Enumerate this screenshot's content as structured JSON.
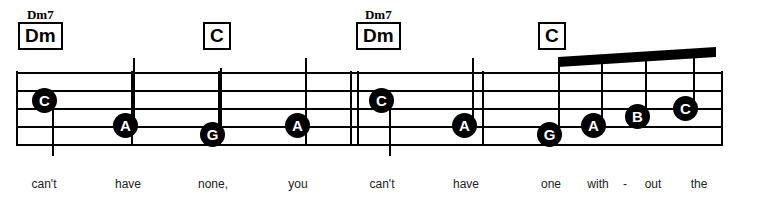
{
  "sheet": {
    "title": "Music notation excerpt",
    "staff": {
      "left": 16,
      "right": 723,
      "top_line_y": 72,
      "line_spacing": 18,
      "line_count": 5
    },
    "barlines": [
      {
        "name": "barline-start",
        "x": 16,
        "y": 71,
        "height": 75,
        "width": 2
      },
      {
        "name": "barline-1",
        "x": 131,
        "y": 71,
        "height": 75,
        "width": 2
      },
      {
        "name": "barline-2",
        "x": 218,
        "y": 71,
        "height": 75,
        "width": 2
      },
      {
        "name": "barline-3",
        "x": 305,
        "y": 71,
        "height": 75,
        "width": 2
      },
      {
        "name": "barline-double-a",
        "x": 350,
        "y": 71,
        "height": 75,
        "width": 2
      },
      {
        "name": "barline-double-b",
        "x": 357,
        "y": 71,
        "height": 75,
        "width": 2
      },
      {
        "name": "barline-4",
        "x": 482,
        "y": 71,
        "height": 75,
        "width": 2
      },
      {
        "name": "barline-end",
        "x": 721,
        "y": 71,
        "height": 75,
        "width": 2
      }
    ],
    "chords": [
      {
        "label": "Dm",
        "alt": "Dm7",
        "x": 18,
        "y": 8
      },
      {
        "label": "C",
        "alt": "",
        "x": 203,
        "y": 8
      },
      {
        "label": "Dm",
        "alt": "Dm7",
        "x": 356,
        "y": 8
      },
      {
        "label": "C",
        "alt": "",
        "x": 538,
        "y": 8
      }
    ],
    "notes": [
      {
        "pitch": "C",
        "x": 32,
        "y": 88,
        "stem": "up",
        "stem_x": 52,
        "stem_top": 100,
        "stem_bottom": 156,
        "beamed": false
      },
      {
        "pitch": "A",
        "x": 113,
        "y": 113,
        "stem": "up",
        "stem_x": 133,
        "stem_top": 58,
        "stem_bottom": 126,
        "beamed": false
      },
      {
        "pitch": "G",
        "x": 200,
        "y": 122,
        "stem": "up",
        "stem_x": 220,
        "stem_top": 68,
        "stem_bottom": 135,
        "beamed": false
      },
      {
        "pitch": "A",
        "x": 285,
        "y": 113,
        "stem": "up",
        "stem_x": 305,
        "stem_top": 58,
        "stem_bottom": 126,
        "beamed": false
      },
      {
        "pitch": "C",
        "x": 369,
        "y": 88,
        "stem": "up",
        "stem_x": 389,
        "stem_top": 100,
        "stem_bottom": 156,
        "beamed": false
      },
      {
        "pitch": "A",
        "x": 452,
        "y": 113,
        "stem": "up",
        "stem_x": 472,
        "stem_top": 58,
        "stem_bottom": 126,
        "beamed": false
      },
      {
        "pitch": "G",
        "x": 537,
        "y": 122,
        "stem": "up",
        "stem_x": 558,
        "stem_top": 62,
        "stem_bottom": 135,
        "beamed": true
      },
      {
        "pitch": "A",
        "x": 581,
        "y": 113,
        "stem": "up",
        "stem_x": 601,
        "stem_top": 59,
        "stem_bottom": 126,
        "beamed": true
      },
      {
        "pitch": "B",
        "x": 625,
        "y": 104,
        "stem": "up",
        "stem_x": 645,
        "stem_top": 56,
        "stem_bottom": 117,
        "beamed": true
      },
      {
        "pitch": "C",
        "x": 673,
        "y": 96,
        "stem": "up",
        "stem_x": 693,
        "stem_top": 50,
        "stem_bottom": 109,
        "beamed": true
      }
    ],
    "beam": {
      "name": "eighth-note-beam",
      "x_left": 558,
      "x_right": 716,
      "y_left_top": 57,
      "y_right_top": 47,
      "thickness": 10
    },
    "lyrics": [
      {
        "text": "can't",
        "x": 44,
        "y": 177
      },
      {
        "text": "have",
        "x": 128,
        "y": 177
      },
      {
        "text": "none,",
        "x": 213,
        "y": 177
      },
      {
        "text": "you",
        "x": 298,
        "y": 177
      },
      {
        "text": "can't",
        "x": 382,
        "y": 177
      },
      {
        "text": "have",
        "x": 466,
        "y": 177
      },
      {
        "text": "one",
        "x": 551,
        "y": 177
      },
      {
        "text": "with",
        "x": 598,
        "y": 177
      },
      {
        "text": "-",
        "x": 625,
        "y": 177
      },
      {
        "text": "out",
        "x": 653,
        "y": 177
      },
      {
        "text": "the",
        "x": 699,
        "y": 177
      }
    ],
    "colors": {
      "ink": "#000000",
      "lyric_ink": "#222222",
      "paper": "#ffffff",
      "notehead_text": "#ffffff"
    }
  }
}
